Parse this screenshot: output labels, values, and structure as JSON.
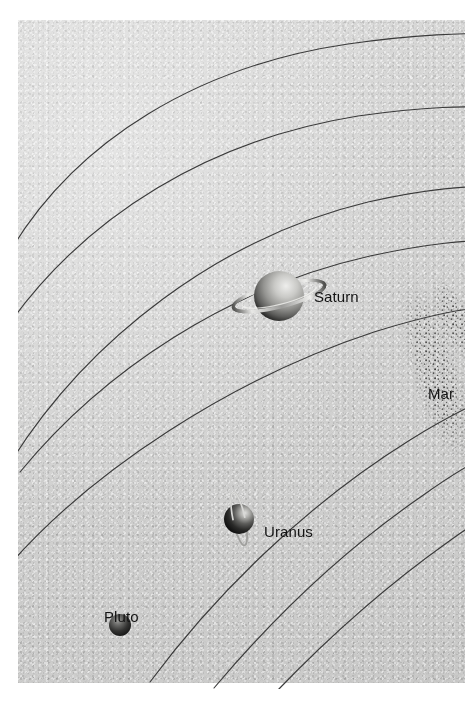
{
  "figure": {
    "type": "solar-system-orbit-diagram",
    "background_color": "#d4d4d3",
    "page_color": "#ffffff",
    "orbit_line_color": "#3a3a3a"
  },
  "labels": {
    "saturn": "Saturn",
    "uranus": "Uranus",
    "pluto": "Pluto",
    "mars": "Mar"
  },
  "bodies": [
    {
      "name": "Saturn",
      "label": "Saturn",
      "x": 279,
      "y": 296,
      "radius": 25,
      "has_rings": true,
      "ring_tilt_deg": -14,
      "body_color": "#8e8e8c",
      "highlight_color": "#e2e2e0",
      "shadow_color": "#3c3c3c"
    },
    {
      "name": "Uranus",
      "label": "Uranus",
      "x": 239,
      "y": 519,
      "radius": 15,
      "has_rings": true,
      "ring_tilt_deg": 78,
      "body_color": "#4a4a4a",
      "highlight_color": "#d5d5d3",
      "shadow_color": "#161616"
    },
    {
      "name": "Pluto",
      "label": "Pluto",
      "x": 120,
      "y": 625,
      "radius": 11,
      "has_rings": false,
      "body_color": "#3a3a3a",
      "highlight_color": "#9a9a98",
      "shadow_color": "#101010"
    },
    {
      "name": "Mars",
      "label": "Mar",
      "x": 462,
      "y": 379,
      "radius": 0,
      "has_rings": false,
      "clipped_at_right_edge": true
    }
  ],
  "asteroid_belt": {
    "name": "asteroid-belt",
    "visible": true,
    "stipple_color": "#4b4b4b",
    "center_x": 430,
    "center_y": 355
  },
  "orbits": [
    {
      "name": "orbit-outermost-pluto",
      "index": 0
    },
    {
      "name": "orbit-neptune",
      "index": 1
    },
    {
      "name": "orbit-uranus",
      "index": 2
    },
    {
      "name": "orbit-saturn",
      "index": 3
    },
    {
      "name": "orbit-jupiter",
      "index": 4
    },
    {
      "name": "orbit-inner-asteroid",
      "index": 5
    },
    {
      "name": "orbit-mars",
      "index": 6
    }
  ]
}
